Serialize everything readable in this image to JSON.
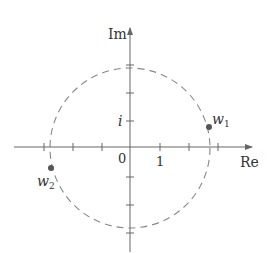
{
  "diagram": {
    "type": "complex-plane",
    "axes": {
      "real_label": "Re",
      "imag_label": "Im",
      "origin_label": "0",
      "real_tick_label": "1",
      "imag_tick_label": "i"
    },
    "circle": {
      "style": "dashed",
      "center": [
        0,
        0
      ],
      "radius_units": 2.75
    },
    "points": [
      {
        "name": "w1",
        "label_base": "w",
        "label_sub": "1"
      },
      {
        "name": "w2",
        "label_base": "w",
        "label_sub": "2"
      }
    ],
    "colors": {
      "axis": "#666666",
      "circle": "#888888",
      "point": "#555555",
      "text": "#333333"
    }
  }
}
